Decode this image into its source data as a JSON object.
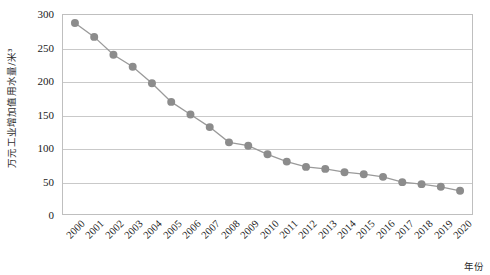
{
  "chart_data": {
    "type": "line",
    "title": "",
    "subtitle": "",
    "xlabel": "年份",
    "ylabel": "万元工业增加值用水量/米³",
    "categories": [
      "2000",
      "2001",
      "2002",
      "2003",
      "2004",
      "2005",
      "2006",
      "2007",
      "2008",
      "2009",
      "2010",
      "2011",
      "2012",
      "2013",
      "2014",
      "2015",
      "2016",
      "2017",
      "2018",
      "2019",
      "2020"
    ],
    "values": [
      288,
      267,
      240,
      222,
      197,
      169,
      150,
      131,
      108,
      103,
      90,
      79,
      71,
      68,
      63,
      60,
      56,
      48,
      45,
      41,
      35
    ],
    "series": [
      {
        "name": "万元工业增加值用水量",
        "values": [
          288,
          267,
          240,
          222,
          197,
          169,
          150,
          131,
          108,
          103,
          90,
          79,
          71,
          68,
          63,
          60,
          56,
          48,
          45,
          41,
          35
        ]
      }
    ],
    "ylim": [
      0,
      300
    ],
    "y_ticks": [
      0,
      50,
      100,
      150,
      200,
      250,
      300
    ],
    "y_tick_labels": [
      "0",
      "50",
      "100",
      "150",
      "200",
      "250",
      "300"
    ],
    "grid": true,
    "grid_axis": "y",
    "legend": false,
    "legend_position": "none",
    "marker": "circle",
    "marker_color": "#8c8c8c",
    "line_color": "#9a9a9a",
    "gridline_color": "#c9c9c9",
    "axis_border_color": "#bfbfbf",
    "plot_background": "#ffffff",
    "x_tick_rotation": -45
  }
}
